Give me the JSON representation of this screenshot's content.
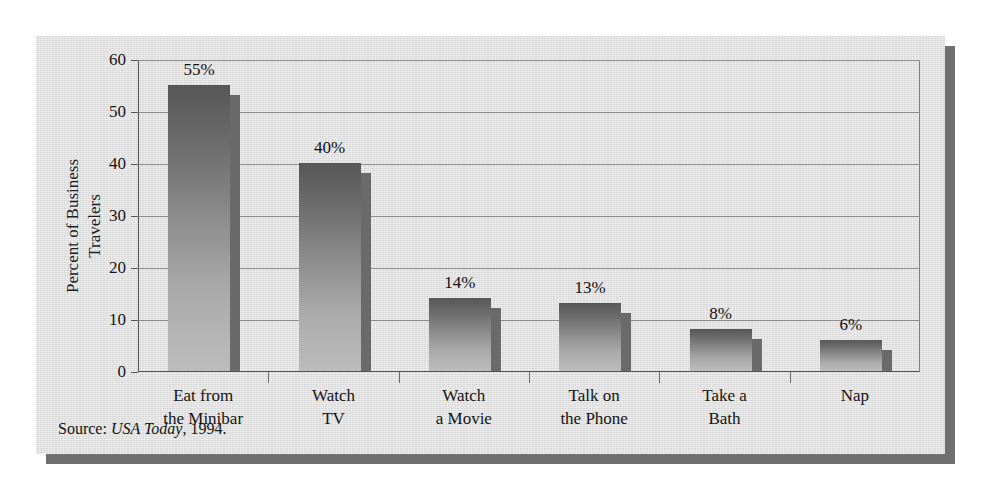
{
  "chart_data": {
    "type": "bar",
    "title": "",
    "xlabel": "",
    "ylabel_lines": [
      "Percent of Business",
      "Travelers"
    ],
    "ylabel": "Percent of Business Travelers",
    "categories": [
      "Eat from the Minibar",
      "Watch TV",
      "Watch a Movie",
      "Talk on the Phone",
      "Take a Bath",
      "Nap"
    ],
    "category_lines": [
      [
        "Eat from",
        "the Minibar"
      ],
      [
        "Watch",
        "TV"
      ],
      [
        "Watch",
        "a Movie"
      ],
      [
        "Talk on",
        "the Phone"
      ],
      [
        "Take a",
        "Bath"
      ],
      [
        "Nap"
      ]
    ],
    "values": [
      55,
      40,
      14,
      13,
      8,
      6
    ],
    "value_labels": [
      "55%",
      "40%",
      "14%",
      "13%",
      "8%",
      "6%"
    ],
    "ylim": [
      0,
      60
    ],
    "yticks": [
      0,
      10,
      20,
      30,
      40,
      50,
      60
    ],
    "ytick_labels": [
      "0",
      "10",
      "20",
      "30",
      "40",
      "50",
      "60"
    ],
    "grid": true,
    "legend": false,
    "legend_position": "none",
    "bar_style": "vertical-gradient-with-right-shadow"
  },
  "source_note": {
    "prefix": "Source: ",
    "publication": "USA Today",
    "suffix": ", 1994."
  },
  "colors": {
    "panel_background": "#dedede",
    "panel_shadow": "#6f6f6f",
    "bar_top": "#575757",
    "bar_bottom": "#bcbcbc",
    "bar_side_shadow": "#6a6a6a",
    "gridline": "#8a8a8a",
    "axis": "#555555",
    "text": "#141414"
  }
}
